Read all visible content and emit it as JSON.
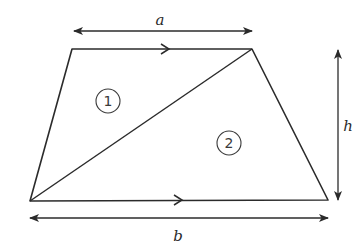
{
  "diagram": {
    "type": "trapezium-area-derivation",
    "shape": "trapezium",
    "vertices": {
      "top_left": [
        72,
        49
      ],
      "top_right": [
        252,
        49
      ],
      "bottom_right": [
        328,
        200
      ],
      "bottom_left": [
        30,
        201
      ]
    },
    "diagonal": {
      "from": "bottom_left",
      "to": "top_right"
    },
    "parallel_sides": [
      "top",
      "bottom"
    ],
    "labels": {
      "top_length": "a",
      "bottom_length": "b",
      "height": "h"
    },
    "regions": [
      {
        "id": "1",
        "label": "1",
        "center": [
          108,
          101
        ]
      },
      {
        "id": "2",
        "label": "2",
        "center": [
          229,
          143
        ]
      }
    ],
    "colors": {
      "stroke": "#2b2b2b",
      "background": "#ffffff"
    }
  }
}
